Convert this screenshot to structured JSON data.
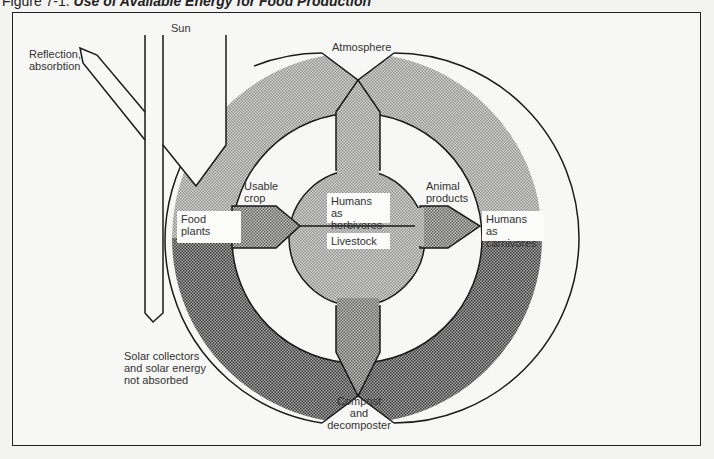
{
  "figure": {
    "number_label": "Figure 7-1.",
    "title": "Use of Available Energy for Food Production"
  },
  "labels": {
    "sun": "Sun",
    "reflection": [
      "Reflection,",
      "absorbtion"
    ],
    "atmosphere": "Atmosphere",
    "usable_crop": [
      "Usable",
      "crop"
    ],
    "food_plants": [
      "Food",
      "plants"
    ],
    "humans_herbivores": [
      "Humans as",
      "herbivores"
    ],
    "livestock": "Livestock",
    "animal_products": [
      "Animal",
      "products"
    ],
    "humans_carnivores": [
      "Humans as",
      "carnivores"
    ],
    "solar_collectors": [
      "Solar collectors",
      "and solar energy",
      "not absorbed"
    ],
    "compost": [
      "Compost",
      "and",
      "decomposter"
    ]
  },
  "colors": {
    "outline": "#1a1a1a",
    "light_shade": "#b9b9b9",
    "dark_shade": "#8a8a8a",
    "background": "#f7f7f5"
  }
}
